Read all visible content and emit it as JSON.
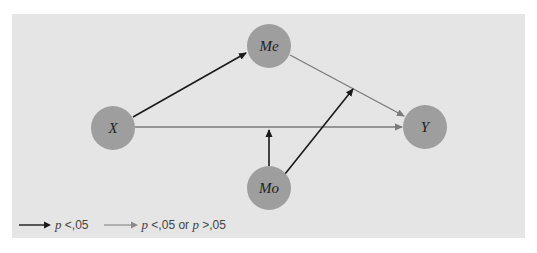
{
  "diagram": {
    "type": "moderated mediation path model",
    "colors": {
      "panel": "#e5e5e5",
      "node_fill": "#9e9e9e",
      "significant_path": "#1a1a1a",
      "nonsignificant_path": "#7a7a7a"
    },
    "nodes": [
      {
        "id": "X",
        "label": "X",
        "cx": 113,
        "cy": 128,
        "r": 22
      },
      {
        "id": "Me",
        "label": "Me",
        "cx": 269,
        "cy": 46,
        "r": 22
      },
      {
        "id": "Y",
        "label": "Y",
        "cx": 425,
        "cy": 127,
        "r": 22
      },
      {
        "id": "Mo",
        "label": "Mo",
        "cx": 269,
        "cy": 188,
        "r": 22
      }
    ],
    "edges": [
      {
        "from": "X",
        "to": "Me",
        "style": "black",
        "label": "p <,05"
      },
      {
        "from": "Me",
        "to": "Y",
        "style": "gray",
        "label": "p <,05 or p >,05"
      },
      {
        "from": "X",
        "to": "Y",
        "style": "gray",
        "label": "p <,05 or p >,05"
      },
      {
        "from": "Mo",
        "to": "X-Y path",
        "style": "black",
        "label": "p <,05"
      },
      {
        "from": "Mo",
        "to": "Me-Y path",
        "style": "black",
        "label": "p <,05"
      }
    ]
  },
  "legend": {
    "items": [
      {
        "style": "black",
        "p1": "p",
        "t1": " <,05",
        "p2": "",
        "t2": ""
      },
      {
        "style": "gray",
        "p1": "p",
        "t1": " <,05 or ",
        "p2": "p",
        "t2": " >,05"
      }
    ]
  }
}
